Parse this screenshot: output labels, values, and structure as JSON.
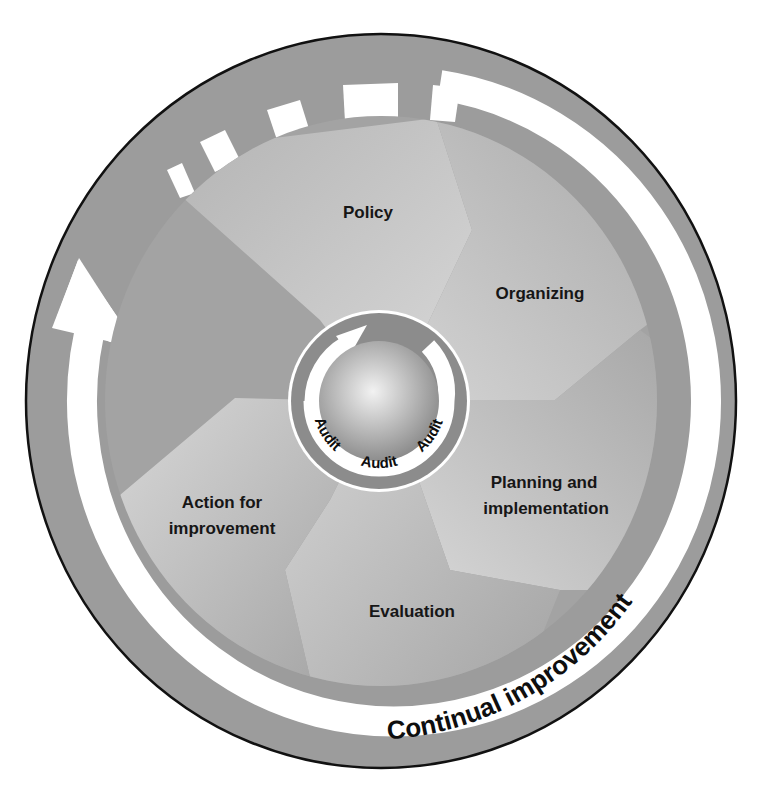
{
  "diagram": {
    "type": "cycle",
    "segments": [
      {
        "id": "policy",
        "label": "Policy"
      },
      {
        "id": "organizing",
        "label": "Organizing"
      },
      {
        "id": "planning",
        "label_line1": "Planning and",
        "label_line2": "implementation"
      },
      {
        "id": "evaluation",
        "label": "Evaluation"
      },
      {
        "id": "action",
        "label_line1": "Action for",
        "label_line2": "improvement"
      }
    ],
    "center_ring": {
      "labels": [
        "Audit",
        "Audit",
        "Audit"
      ]
    },
    "outer_ring": {
      "label": "Continual improvement"
    },
    "colors": {
      "outer_ring": "#9c9c9c",
      "band": "#ffffff",
      "segment_light": "#cfcfcf",
      "segment_dark": "#a4a4a4",
      "outline": "#111111"
    }
  },
  "caption": {
    "text": ""
  }
}
